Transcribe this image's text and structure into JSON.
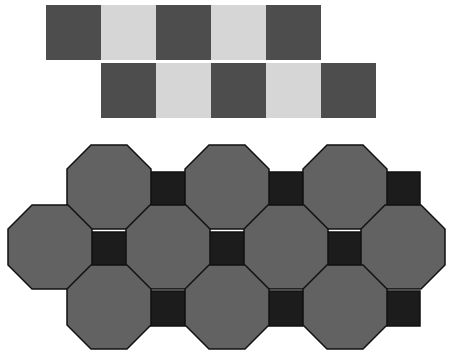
{
  "figure": {
    "title": "",
    "colors": {
      "dark_square": "#4d4d4d",
      "light_square": "#d6d6d6",
      "octagon_fill": "#626262",
      "small_square_fill": "#1c1c1c",
      "outline": "#111111",
      "background": "#ffffff"
    },
    "checkerboard": {
      "square_size": 55,
      "rows": [
        {
          "x": 46,
          "y": 5,
          "pattern": [
            "dark",
            "light",
            "dark",
            "light",
            "dark"
          ]
        },
        {
          "x": 101,
          "y": 63,
          "pattern": [
            "dark",
            "light",
            "dark",
            "light",
            "dark"
          ]
        }
      ]
    },
    "octagon_tiling": {
      "octagon_size": 84,
      "corner_cut": 24,
      "octagons": [
        {
          "x": 67,
          "y": 145
        },
        {
          "x": 185,
          "y": 145
        },
        {
          "x": 303,
          "y": 145
        },
        {
          "x": 8,
          "y": 205
        },
        {
          "x": 126,
          "y": 205
        },
        {
          "x": 244,
          "y": 205
        },
        {
          "x": 361,
          "y": 205
        },
        {
          "x": 67,
          "y": 265
        },
        {
          "x": 185,
          "y": 265
        },
        {
          "x": 303,
          "y": 265
        }
      ],
      "small_squares": [
        {
          "x": 150,
          "y": 172,
          "size": 35
        },
        {
          "x": 268,
          "y": 172,
          "size": 35
        },
        {
          "x": 385,
          "y": 172,
          "size": 35
        },
        {
          "x": 92,
          "y": 232,
          "size": 35
        },
        {
          "x": 209,
          "y": 232,
          "size": 35
        },
        {
          "x": 327,
          "y": 232,
          "size": 35
        },
        {
          "x": 150,
          "y": 291,
          "size": 35
        },
        {
          "x": 268,
          "y": 291,
          "size": 35
        },
        {
          "x": 385,
          "y": 291,
          "size": 35
        }
      ]
    }
  }
}
